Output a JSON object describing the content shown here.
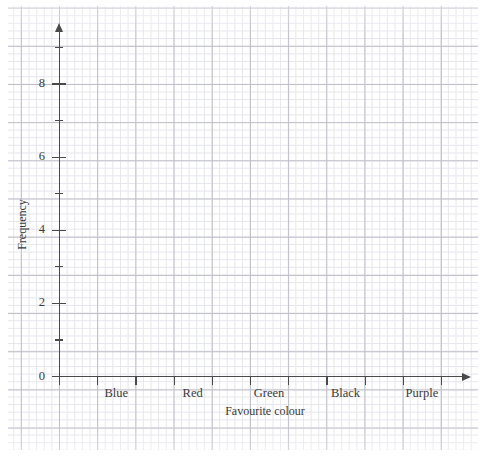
{
  "chart_data": {
    "type": "bar",
    "title": "",
    "subtitle": "",
    "xlabel": "Favourite colour",
    "ylabel": "Frequency",
    "categories": [
      "Blue",
      "Red",
      "Green",
      "Black",
      "Purple"
    ],
    "values": [
      0,
      0,
      0,
      0,
      0
    ],
    "series": [
      {
        "name": "Frequency",
        "values": [
          0,
          0,
          0,
          0,
          0
        ]
      }
    ],
    "ylim": [
      0,
      9.5
    ],
    "y_tick_labels": [
      "0",
      "2",
      "4",
      "6",
      "8"
    ],
    "y_tick_values": [
      0,
      2,
      4,
      6,
      8
    ],
    "y_minor_tick_values": [
      1,
      3,
      5,
      7,
      9
    ],
    "grid": true,
    "grid_style": "graph-paper",
    "legend": "none",
    "annotations": [],
    "note": "Empty axes of a blank bar chart template; no bars drawn."
  },
  "axes": {
    "y": {
      "title": "Frequency",
      "ticks": [
        {
          "label": "0",
          "value": 0,
          "type": "major"
        },
        {
          "label": "",
          "value": 1,
          "type": "minor"
        },
        {
          "label": "2",
          "value": 2,
          "type": "major"
        },
        {
          "label": "",
          "value": 3,
          "type": "minor"
        },
        {
          "label": "4",
          "value": 4,
          "type": "major"
        },
        {
          "label": "",
          "value": 5,
          "type": "minor"
        },
        {
          "label": "6",
          "value": 6,
          "type": "major"
        },
        {
          "label": "",
          "value": 7,
          "type": "minor"
        },
        {
          "label": "8",
          "value": 8,
          "type": "major"
        },
        {
          "label": "",
          "value": 9,
          "type": "minor"
        }
      ]
    },
    "x": {
      "title": "Favourite colour",
      "categories": [
        {
          "label": "Blue"
        },
        {
          "label": "Red"
        },
        {
          "label": "Green"
        },
        {
          "label": "Black"
        },
        {
          "label": "Purple"
        }
      ],
      "tick_count": 11
    }
  },
  "colors": {
    "axis": "#4a4a4a",
    "grid_minor": "#e4e4ec",
    "grid_major": "#b9b9c4",
    "text": "#3a3a3a",
    "background": "#ffffff"
  }
}
